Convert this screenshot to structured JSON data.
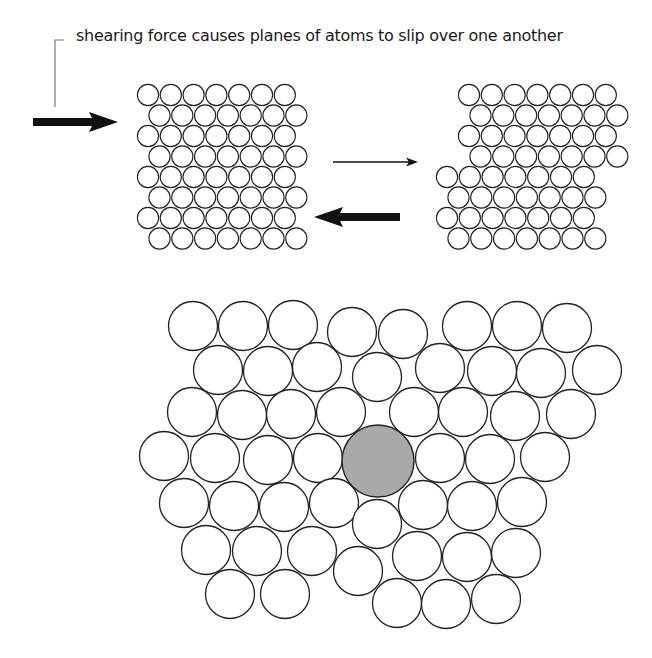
{
  "caption": "shearing force causes planes of atoms to slip over one another",
  "colors": {
    "stroke": "#222222",
    "atom_fill": "#ffffff",
    "highlight_fill": "#a9a9a9",
    "arrow": "#111111",
    "bracket": "#777777"
  },
  "bracket": {
    "x": 55,
    "y_top": 40,
    "y_bottom": 107,
    "x_tick_end": 64
  },
  "arrows": [
    {
      "name": "force-arrow-right",
      "type": "thick",
      "x1": 33,
      "x2": 118,
      "y": 122
    },
    {
      "name": "transition-arrow",
      "type": "thin",
      "x1": 333,
      "x2": 418,
      "y": 162
    },
    {
      "name": "force-arrow-left",
      "type": "thick",
      "x1": 400,
      "x2": 314,
      "y": 217
    }
  ],
  "lattice_before": {
    "radius": 11,
    "pitch_x": 22.8,
    "pitch_y": 20.5,
    "top": 84,
    "rows": [
      {
        "x": 137,
        "count": 7
      },
      {
        "x": 148.5,
        "count": 7
      },
      {
        "x": 137,
        "count": 7
      },
      {
        "x": 148.5,
        "count": 7
      },
      {
        "x": 137,
        "count": 7
      },
      {
        "x": 148.5,
        "count": 7
      },
      {
        "x": 137,
        "count": 7
      },
      {
        "x": 148.5,
        "count": 7
      }
    ]
  },
  "lattice_after": {
    "radius": 11,
    "pitch_x": 22.8,
    "pitch_y": 20.5,
    "top": 84,
    "rows": [
      {
        "x": 458,
        "count": 7
      },
      {
        "x": 469.5,
        "count": 7
      },
      {
        "x": 458,
        "count": 7
      },
      {
        "x": 469.5,
        "count": 7
      },
      {
        "x": 436,
        "count": 7
      },
      {
        "x": 447.5,
        "count": 7
      },
      {
        "x": 436,
        "count": 7
      },
      {
        "x": 447.5,
        "count": 7
      }
    ]
  },
  "defect_cluster": {
    "radius": 25,
    "atoms": [
      [
        193,
        326
      ],
      [
        243,
        326
      ],
      [
        293,
        325
      ],
      [
        352,
        332
      ],
      [
        403,
        334
      ],
      [
        467,
        326
      ],
      [
        517,
        326
      ],
      [
        567,
        328
      ],
      [
        218,
        370
      ],
      [
        268,
        371
      ],
      [
        317,
        367
      ],
      [
        377,
        377
      ],
      [
        440,
        368
      ],
      [
        492,
        371
      ],
      [
        541,
        373
      ],
      [
        597,
        370
      ],
      [
        192,
        412
      ],
      [
        242,
        415
      ],
      [
        291,
        414
      ],
      [
        341,
        412
      ],
      [
        414,
        412
      ],
      [
        463,
        412
      ],
      [
        515,
        416
      ],
      [
        571,
        414
      ],
      [
        164,
        456
      ],
      [
        215,
        458
      ],
      [
        268,
        460
      ],
      [
        318,
        458
      ],
      [
        440,
        458
      ],
      [
        490,
        459
      ],
      [
        545,
        457
      ],
      [
        184,
        503
      ],
      [
        234,
        506
      ],
      [
        284,
        507
      ],
      [
        334,
        503
      ],
      [
        377,
        524
      ],
      [
        423,
        505
      ],
      [
        472,
        506
      ],
      [
        522,
        502
      ],
      [
        206,
        550
      ],
      [
        257,
        551
      ],
      [
        312,
        551
      ],
      [
        358,
        571
      ],
      [
        417,
        556
      ],
      [
        467,
        557
      ],
      [
        516,
        553
      ],
      [
        230,
        594
      ],
      [
        285,
        594
      ],
      [
        397,
        603
      ],
      [
        446,
        604
      ],
      [
        496,
        599
      ]
    ],
    "interstitial": {
      "cx": 378,
      "cy": 461,
      "r": 36
    }
  }
}
